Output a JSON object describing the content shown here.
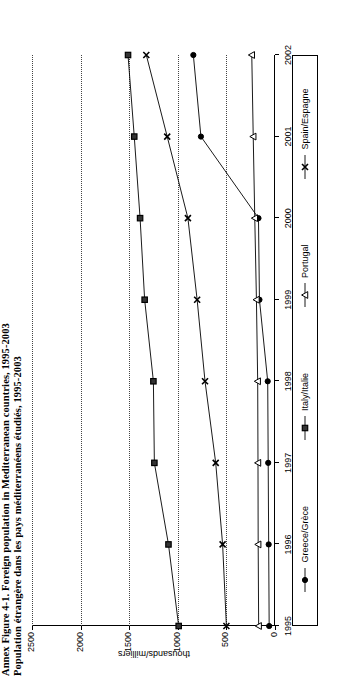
{
  "figure": {
    "title_line1": "Annex Figure 4-1. Foreign population in Mediterranean countries, 1995-2003",
    "title_line2": "Population étrangère dans les pays méditerranéens étudiés, 1995-2003"
  },
  "legend": {
    "entries": [
      {
        "label": "Greece/Grèce",
        "marker": "circle-filled",
        "color": "#000000"
      },
      {
        "label": "Italy/Italie",
        "marker": "square-filled",
        "color": "#000000"
      },
      {
        "label": "Portugal",
        "marker": "triangle-open",
        "color": "#000000"
      },
      {
        "label": "Spain/Espagne",
        "marker": "x-cross",
        "color": "#000000"
      }
    ]
  },
  "chart_data": {
    "type": "line",
    "title": "Annex Figure 4-1. Foreign population in Mediterranean countries, 1995-2003",
    "subtitle": "Population étrangère dans les pays méditerranéens étudiés, 1995-2003",
    "orientation": "rotated-90",
    "xlabel": "",
    "ylabel": "thousands/milliers",
    "x": [
      1995,
      1996,
      1997,
      1998,
      1999,
      2000,
      2001,
      2002
    ],
    "xlim": [
      1995,
      2002
    ],
    "ylim": [
      0,
      2500
    ],
    "yticks": [
      0,
      500,
      1000,
      1500,
      2000,
      2500
    ],
    "grid": "dotted-vertical-on-y-values",
    "legend_position": "bottom",
    "series": [
      {
        "name": "Greece/Grèce",
        "marker": "circle-filled",
        "values": [
          60,
          65,
          70,
          75,
          160,
          170,
          762,
          840
        ]
      },
      {
        "name": "Italy/Italie",
        "marker": "square-filled",
        "values": [
          991,
          1096,
          1241,
          1251,
          1341,
          1388,
          1448,
          1512
        ]
      },
      {
        "name": "Portugal",
        "marker": "triangle-open",
        "values": [
          168,
          173,
          175,
          178,
          191,
          208,
          224,
          239
        ]
      },
      {
        "name": "Spain/Espagne",
        "marker": "x-cross",
        "values": [
          500,
          539,
          610,
          720,
          801,
          896,
          1109,
          1324
        ]
      }
    ]
  }
}
